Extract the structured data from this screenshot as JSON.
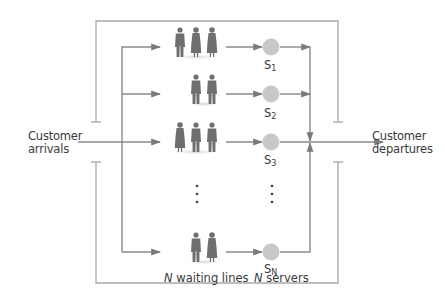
{
  "diagram": {
    "type": "multi-server queueing system (N waiting lines, N servers)",
    "colors": {
      "line": "#8a8a8a",
      "bracket_line": "#a8a8a8",
      "arrowhead": "#7a7a7a",
      "server_fill": "#c8c8c8",
      "person_fill": "#6f6f6f",
      "text": "#3a3a3a"
    },
    "labels": {
      "arrivals_line1": "Customer",
      "arrivals_line2": "arrivals",
      "departures_line1": "Customer",
      "departures_line2": "departures",
      "waiting_lines_var": "N",
      "waiting_lines_text": " waiting lines",
      "servers_var": "N",
      "servers_text": " servers"
    },
    "servers": [
      {
        "base": "S",
        "sub": "1",
        "row": 1,
        "queue_length": 3
      },
      {
        "base": "S",
        "sub": "2",
        "row": 2,
        "queue_length": 2
      },
      {
        "base": "S",
        "sub": "3",
        "row": 3,
        "queue_length": 3
      },
      {
        "base": "S",
        "sub": "N",
        "row": "N",
        "queue_length": 2
      }
    ],
    "ellipsis": "vertical dots between S3 and SN rows",
    "system_boundary": "open bracket enclosing queues and servers (gaps at arrival and departure lines)"
  }
}
